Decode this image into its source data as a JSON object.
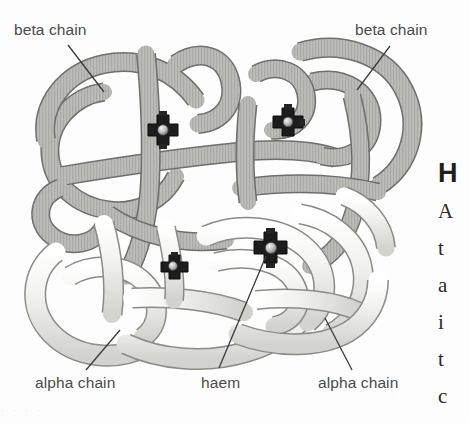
{
  "figure": {
    "background_color": "#fdfdfd",
    "style": "grayscale textbook illustration, ribbon/tube model",
    "chain_count": 4,
    "haem_count": 4
  },
  "labels": {
    "beta_left": "beta chain",
    "beta_right": "beta chain",
    "alpha_left": "alpha chain",
    "haem": "haem",
    "alpha_right": "alpha chain"
  },
  "colors": {
    "beta_chain_fill": "#b9b9b5",
    "beta_chain_shade": "#a3a3a0",
    "alpha_chain_fill": "#eeeeec",
    "alpha_chain_shade": "#d6d6d4",
    "outline": "#6e6e6e",
    "haem_dark": "#1c1c1c",
    "haem_iron": "#cfcfcf",
    "label_text": "#4a4a4a",
    "leader_line": "#3a3a3a"
  },
  "haem_groups": [
    {
      "id": "haem-beta-left",
      "x": 163,
      "y": 130,
      "labelled": false
    },
    {
      "id": "haem-beta-right",
      "x": 288,
      "y": 122,
      "labelled": false
    },
    {
      "id": "haem-alpha-left",
      "x": 174,
      "y": 266,
      "labelled": false
    },
    {
      "id": "haem-alpha-right",
      "x": 271,
      "y": 248,
      "labelled": true
    }
  ],
  "leader_lines": [
    {
      "name": "beta-left-leader",
      "x1": 68,
      "y1": 45,
      "x2": 104,
      "y2": 90
    },
    {
      "name": "beta-right-leader",
      "x1": 390,
      "y1": 46,
      "x2": 358,
      "y2": 88
    },
    {
      "name": "alpha-left-leader",
      "x1": 86,
      "y1": 370,
      "x2": 118,
      "y2": 330
    },
    {
      "name": "haem-leader",
      "x1": 219,
      "y1": 368,
      "x2": 266,
      "y2": 255
    },
    {
      "name": "alpha-right-leader",
      "x1": 352,
      "y1": 370,
      "x2": 326,
      "y2": 318
    }
  ],
  "margin_text": {
    "heading_fragment": "H",
    "line_fragments": [
      "A",
      "t",
      "a",
      "i",
      "t",
      "c"
    ]
  },
  "ghost_text": "·      ·          ·             ·"
}
